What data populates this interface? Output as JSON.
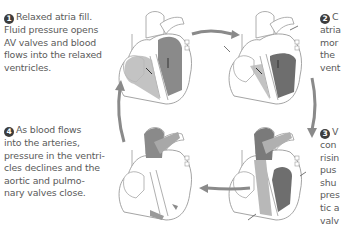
{
  "steps": [
    {
      "number": "1",
      "lines": [
        "Relaxed atria fill.",
        "Fluid pressure opens",
        "AV valves and blood",
        "flows into the relaxed",
        "ventricles."
      ]
    },
    {
      "number": "2",
      "lines": [
        "C",
        "atria",
        "mor",
        "the",
        "vent"
      ]
    },
    {
      "number": "3",
      "lines": [
        "V",
        "con",
        "risin",
        "pus",
        "shu",
        "pres",
        "tic a",
        "valv"
      ]
    },
    {
      "number": "4",
      "lines": [
        "As blood flows",
        "into the arteries,",
        "pressure in the ventri-",
        "cles declines and the",
        "aortic and pulmo-",
        "nary valves close."
      ]
    }
  ],
  "colors": {
    "text": "#5a5a5a",
    "badge": "#3d3d3d",
    "cycle_arrow": "#8a8a8a",
    "heart_outline": "#9a9a9a",
    "chamber_light": "#b8b8b8",
    "chamber_dark": "#6e6e6e"
  }
}
